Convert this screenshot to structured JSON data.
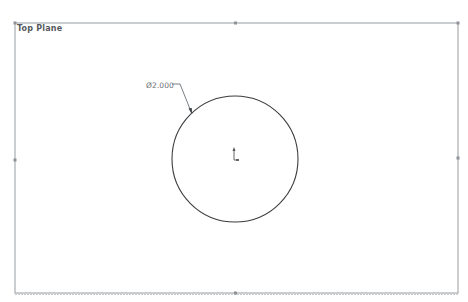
{
  "viewport": {
    "plane_label": "Top Plane",
    "background": "#ffffff",
    "frame_color": "#a8acb0"
  },
  "sketch": {
    "circle": {
      "cx": 235,
      "cy": 159,
      "r": 63,
      "stroke": "#3a3d40"
    },
    "dimension": {
      "label": "Ø2.000",
      "leader_color": "#6a6f75"
    },
    "origin": {
      "x": 235,
      "y": 159
    }
  },
  "plane_frame": {
    "left": 15,
    "top": 23,
    "right": 458,
    "bottom": 293,
    "handles": [
      "top-mid",
      "left-mid",
      "right-mid",
      "bottom-mid",
      "top-right"
    ]
  }
}
